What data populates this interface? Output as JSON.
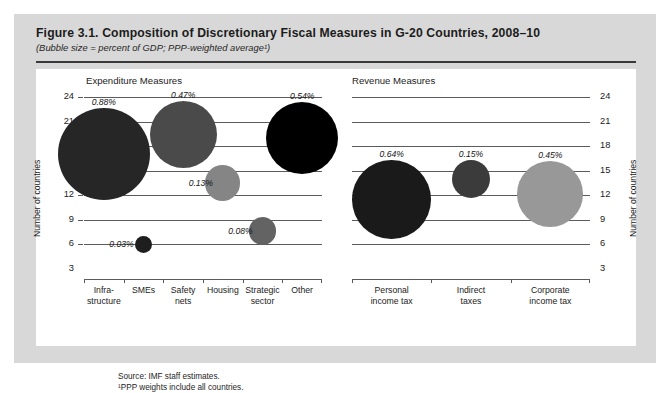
{
  "figure": {
    "title": "Figure 3.1.  Composition of Discretionary Fiscal Measures in G-20 Countries, 2008–10",
    "subtitle": "(Bubble size = percent of GDP; PPP-weighted average¹)",
    "source_line": "Source:  IMF staff estimates.",
    "footnote_line": "¹PPP weights include all countries."
  },
  "chart_data": [
    {
      "type": "scatter",
      "title": "Expenditure Measures",
      "xlabel": "",
      "ylabel": "Number of countries",
      "ylim": [
        3,
        24
      ],
      "yticks": [
        24,
        21,
        18,
        15,
        12,
        9,
        6,
        3
      ],
      "grid": true,
      "legend": "none",
      "axis_side": "left",
      "categories": [
        "Infra-\nstructure",
        "SMEs",
        "Safety\nnets",
        "Housing",
        "Strategic\nsector",
        "Other"
      ],
      "points": [
        {
          "category": "Infra-\nstructure",
          "label_line1": "Infra-",
          "label_line2": "structure",
          "countries": 17.0,
          "bubble_label": "0.88%",
          "size_pct": 0.88,
          "color": "#262626"
        },
        {
          "category": "SMEs",
          "label_line1": "SMEs",
          "label_line2": "",
          "countries": 6.0,
          "bubble_label": "0.03%",
          "size_pct": 0.03,
          "color": "#1e1e1e"
        },
        {
          "category": "Safety\nnets",
          "label_line1": "Safety",
          "label_line2": "nets",
          "countries": 19.4,
          "bubble_label": "0.47%",
          "size_pct": 0.47,
          "color": "#4a4a4a"
        },
        {
          "category": "Housing",
          "label_line1": "Housing",
          "label_line2": "",
          "countries": 13.5,
          "bubble_label": "0.13%",
          "size_pct": 0.13,
          "color": "#858585"
        },
        {
          "category": "Strategic\nsector",
          "label_line1": "Strategic",
          "label_line2": "sector",
          "countries": 7.6,
          "bubble_label": "0.08%",
          "size_pct": 0.08,
          "color": "#636363"
        },
        {
          "category": "Other",
          "label_line1": "Other",
          "label_line2": "",
          "countries": 19.0,
          "bubble_label": "0.54%",
          "size_pct": 0.54,
          "color": "#000000"
        }
      ]
    },
    {
      "type": "scatter",
      "title": "Revenue Measures",
      "xlabel": "",
      "ylabel": "Number of countries",
      "ylim": [
        3,
        24
      ],
      "yticks": [
        24,
        21,
        18,
        15,
        12,
        9,
        6,
        3
      ],
      "grid": true,
      "legend": "none",
      "axis_side": "right",
      "categories": [
        "Personal\nincome tax",
        "Indirect\ntaxes",
        "Corporate\nincome tax"
      ],
      "points": [
        {
          "category": "Personal\nincome tax",
          "label_line1": "Personal",
          "label_line2": "income tax",
          "countries": 11.5,
          "bubble_label": "0.64%",
          "size_pct": 0.64,
          "color": "#1a1a1a"
        },
        {
          "category": "Indirect\ntaxes",
          "label_line1": "Indirect",
          "label_line2": "taxes",
          "countries": 14.0,
          "bubble_label": "0.15%",
          "size_pct": 0.15,
          "color": "#3b3b3b"
        },
        {
          "category": "Corporate\nincome tax",
          "label_line1": "Corporate",
          "label_line2": "income tax",
          "countries": 12.2,
          "bubble_label": "0.45%",
          "size_pct": 0.45,
          "color": "#989898"
        }
      ]
    }
  ]
}
